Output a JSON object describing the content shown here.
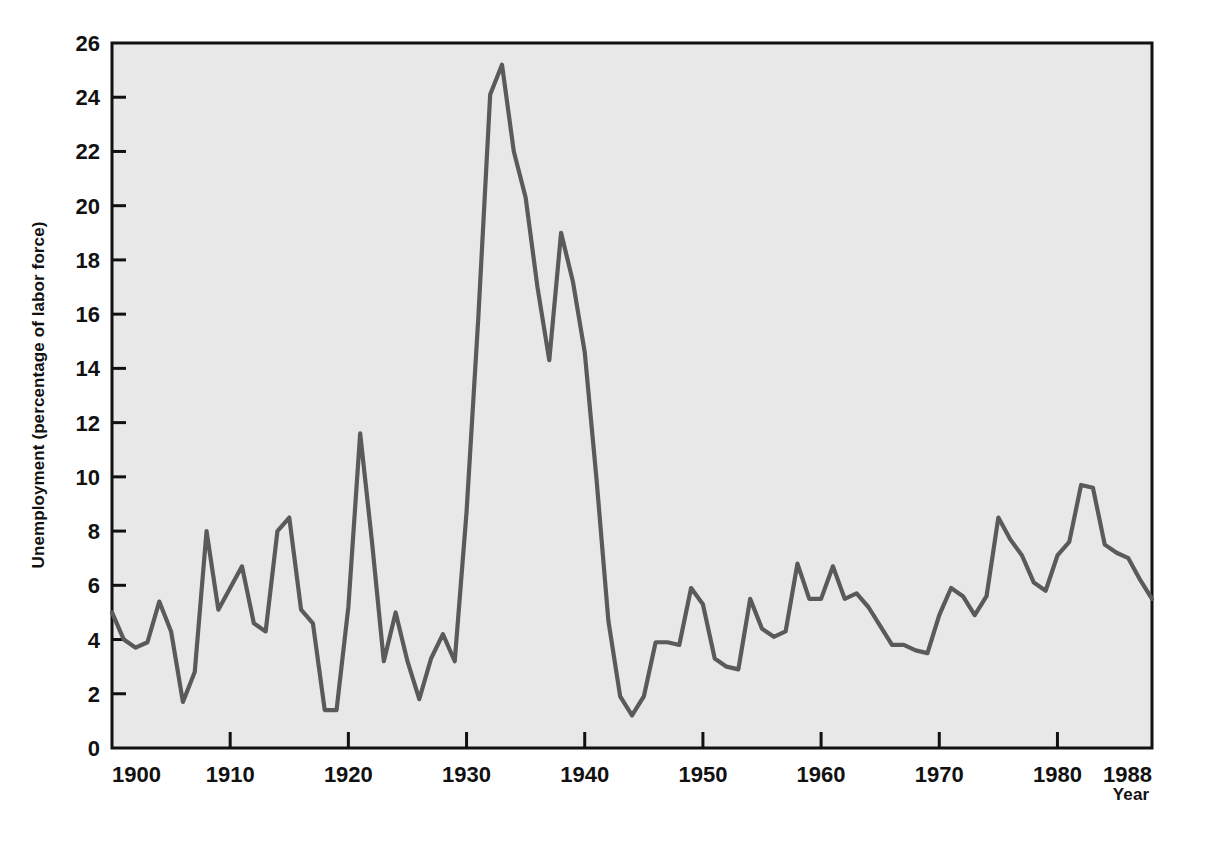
{
  "figure": {
    "background_color": "#ffffff",
    "plot_background_color": "#e8e8e8",
    "line_color": "#5a5a5a",
    "axis_color": "#111111"
  },
  "axes": {
    "ylabel": "Unemployment (percentage of labor force)",
    "xlabel": "Year",
    "y_ticks": [
      "0",
      "2",
      "4",
      "6",
      "8",
      "10",
      "12",
      "14",
      "16",
      "18",
      "20",
      "22",
      "24",
      "26"
    ],
    "x_ticks": [
      "1900",
      "1910",
      "1920",
      "1930",
      "1940",
      "1950",
      "1960",
      "1970",
      "1980",
      "1988"
    ]
  },
  "chart_data": {
    "type": "line",
    "title": "",
    "xlabel": "Year",
    "ylabel": "Unemployment (percentage of labor force)",
    "xlim": [
      1900,
      1988
    ],
    "ylim": [
      0,
      26
    ],
    "grid": false,
    "legend": null,
    "x": [
      1900,
      1901,
      1902,
      1903,
      1904,
      1905,
      1906,
      1907,
      1908,
      1909,
      1910,
      1911,
      1912,
      1913,
      1914,
      1915,
      1916,
      1917,
      1918,
      1919,
      1920,
      1921,
      1922,
      1923,
      1924,
      1925,
      1926,
      1927,
      1928,
      1929,
      1930,
      1931,
      1932,
      1933,
      1934,
      1935,
      1936,
      1937,
      1938,
      1939,
      1940,
      1941,
      1942,
      1943,
      1944,
      1945,
      1946,
      1947,
      1948,
      1949,
      1950,
      1951,
      1952,
      1953,
      1954,
      1955,
      1956,
      1957,
      1958,
      1959,
      1960,
      1961,
      1962,
      1963,
      1964,
      1965,
      1966,
      1967,
      1968,
      1969,
      1970,
      1971,
      1972,
      1973,
      1974,
      1975,
      1976,
      1977,
      1978,
      1979,
      1980,
      1981,
      1982,
      1983,
      1984,
      1985,
      1986,
      1987,
      1988
    ],
    "values": [
      5.0,
      4.0,
      3.7,
      3.9,
      5.4,
      4.3,
      1.7,
      2.8,
      8.0,
      5.1,
      5.9,
      6.7,
      4.6,
      4.3,
      8.0,
      8.5,
      5.1,
      4.6,
      1.4,
      1.4,
      5.2,
      11.6,
      7.6,
      3.2,
      5.0,
      3.2,
      1.8,
      3.3,
      4.2,
      3.2,
      8.7,
      15.9,
      24.1,
      25.2,
      22.0,
      20.3,
      17.0,
      14.3,
      19.0,
      17.2,
      14.6,
      9.9,
      4.7,
      1.9,
      1.2,
      1.9,
      3.9,
      3.9,
      3.8,
      5.9,
      5.3,
      3.3,
      3.0,
      2.9,
      5.5,
      4.4,
      4.1,
      4.3,
      6.8,
      5.5,
      5.5,
      6.7,
      5.5,
      5.7,
      5.2,
      4.5,
      3.8,
      3.8,
      3.6,
      3.5,
      4.9,
      5.9,
      5.6,
      4.9,
      5.6,
      8.5,
      7.7,
      7.1,
      6.1,
      5.8,
      7.1,
      7.6,
      9.7,
      9.6,
      7.5,
      7.2,
      7.0,
      6.2,
      5.5
    ],
    "series": [
      {
        "name": "Unemployment rate",
        "values": [
          5.0,
          4.0,
          3.7,
          3.9,
          5.4,
          4.3,
          1.7,
          2.8,
          8.0,
          5.1,
          5.9,
          6.7,
          4.6,
          4.3,
          8.0,
          8.5,
          5.1,
          4.6,
          1.4,
          1.4,
          5.2,
          11.6,
          7.6,
          3.2,
          5.0,
          3.2,
          1.8,
          3.3,
          4.2,
          3.2,
          8.7,
          15.9,
          24.1,
          25.2,
          22.0,
          20.3,
          17.0,
          14.3,
          19.0,
          17.2,
          14.6,
          9.9,
          4.7,
          1.9,
          1.2,
          1.9,
          3.9,
          3.9,
          3.8,
          5.9,
          5.3,
          3.3,
          3.0,
          2.9,
          5.5,
          4.4,
          4.1,
          4.3,
          6.8,
          5.5,
          5.5,
          6.7,
          5.5,
          5.7,
          5.2,
          4.5,
          3.8,
          3.8,
          3.6,
          3.5,
          4.9,
          5.9,
          5.6,
          4.9,
          5.6,
          8.5,
          7.7,
          7.1,
          6.1,
          5.8,
          7.1,
          7.6,
          9.7,
          9.6,
          7.5,
          7.2,
          7.0,
          6.2,
          5.5
        ]
      }
    ],
    "annotations": []
  }
}
